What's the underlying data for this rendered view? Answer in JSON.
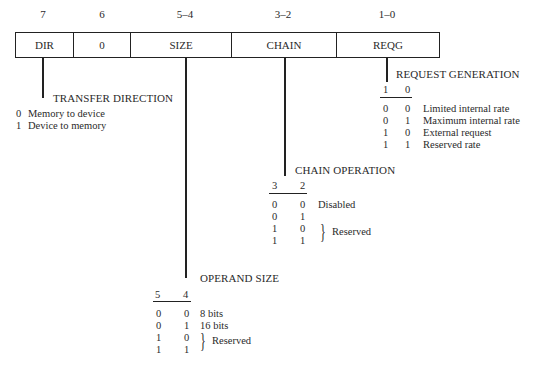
{
  "bit_labels": [
    "7",
    "6",
    "5–4",
    "3–2",
    "1–0"
  ],
  "fields": [
    "DIR",
    "0",
    "SIZE",
    "CHAIN",
    "REQG"
  ],
  "transfer_direction": {
    "title": "TRANSFER DIRECTION",
    "rows": [
      {
        "bit": "0",
        "desc": "Memory to device"
      },
      {
        "bit": "1",
        "desc": "Device to memory"
      }
    ]
  },
  "request_generation": {
    "title": "REQUEST GENERATION",
    "headers": [
      "1",
      "0"
    ],
    "rows": [
      {
        "b1": "0",
        "b0": "0",
        "desc": "Limited internal rate"
      },
      {
        "b1": "0",
        "b0": "1",
        "desc": "Maximum internal rate"
      },
      {
        "b1": "1",
        "b0": "0",
        "desc": "External request"
      },
      {
        "b1": "1",
        "b0": "1",
        "desc": "Reserved rate"
      }
    ]
  },
  "chain_operation": {
    "title": "CHAIN OPERATION",
    "headers": [
      "3",
      "2"
    ],
    "rows": [
      {
        "b1": "0",
        "b0": "0",
        "desc": "Disabled"
      },
      {
        "b1": "0",
        "b0": "1",
        "desc": ""
      },
      {
        "b1": "1",
        "b0": "0",
        "desc": ""
      },
      {
        "b1": "1",
        "b0": "1",
        "desc": ""
      }
    ],
    "reserved_label": "Reserved"
  },
  "operand_size": {
    "title": "OPERAND SIZE",
    "headers": [
      "5",
      "4"
    ],
    "rows": [
      {
        "b1": "0",
        "b0": "0",
        "desc": "8 bits"
      },
      {
        "b1": "0",
        "b0": "1",
        "desc": "16 bits"
      },
      {
        "b1": "1",
        "b0": "0",
        "desc": ""
      },
      {
        "b1": "1",
        "b0": "1",
        "desc": ""
      }
    ],
    "reserved_label": "Reserved"
  }
}
